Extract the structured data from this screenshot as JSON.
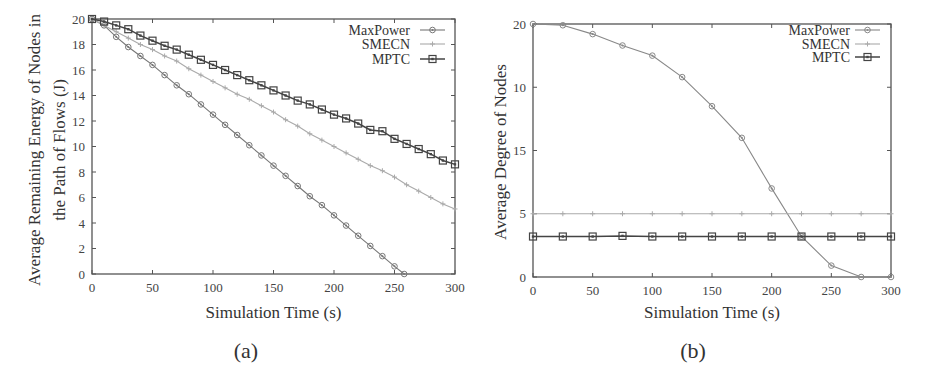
{
  "chart_data": [
    {
      "id": "a",
      "type": "line",
      "caption": "(a)",
      "title": "",
      "xlabel": "Simulation Time (s)",
      "ylabel": [
        "Average Remaining Energy of Nodes in",
        "the Path of Flows (J)"
      ],
      "xlim": [
        0,
        300
      ],
      "ylim": [
        0,
        20
      ],
      "xticks": [
        0,
        50,
        100,
        150,
        200,
        250,
        300
      ],
      "xtick_labels": [
        "0",
        "50",
        "100",
        "150",
        "200",
        "250",
        "300"
      ],
      "yticks": [
        0,
        2,
        4,
        6,
        8,
        10,
        12,
        14,
        16,
        18,
        20
      ],
      "ytick_labels": [
        "0",
        "2",
        "4",
        "6",
        "8",
        "10",
        "12",
        "14",
        "16",
        "18",
        "20"
      ],
      "grid": false,
      "legend_position": "upper right",
      "series": [
        {
          "name": "MaxPower",
          "color": "#777777",
          "marker": "circle-dot",
          "x": [
            0,
            10,
            20,
            30,
            40,
            50,
            60,
            70,
            80,
            90,
            100,
            110,
            120,
            130,
            140,
            150,
            160,
            170,
            180,
            190,
            200,
            210,
            220,
            230,
            240,
            250,
            258
          ],
          "y": [
            20,
            19.5,
            18.6,
            17.8,
            17.1,
            16.4,
            15.6,
            14.8,
            14.1,
            13.3,
            12.5,
            11.7,
            10.9,
            10.1,
            9.3,
            8.5,
            7.7,
            6.9,
            6.1,
            5.4,
            4.6,
            3.8,
            3.0,
            2.2,
            1.4,
            0.6,
            0
          ]
        },
        {
          "name": "SMECN",
          "color": "#aaaaaa",
          "marker": "plus",
          "x": [
            0,
            10,
            20,
            30,
            40,
            50,
            60,
            70,
            80,
            90,
            100,
            110,
            120,
            130,
            140,
            150,
            160,
            170,
            180,
            190,
            200,
            210,
            220,
            230,
            240,
            250,
            260,
            270,
            280,
            290,
            300
          ],
          "y": [
            20,
            19.5,
            19.0,
            18.5,
            18.0,
            17.6,
            17.1,
            16.7,
            16.1,
            15.6,
            15.1,
            14.6,
            14.1,
            13.7,
            13.2,
            12.7,
            12.1,
            11.6,
            11.0,
            10.5,
            10.0,
            9.5,
            9.0,
            8.5,
            8.1,
            7.6,
            7.0,
            6.5,
            6.0,
            5.5,
            5.1
          ]
        },
        {
          "name": "MPTC",
          "color": "#444444",
          "marker": "square",
          "x": [
            0,
            10,
            20,
            30,
            40,
            50,
            60,
            70,
            80,
            90,
            100,
            110,
            120,
            130,
            140,
            150,
            160,
            170,
            180,
            190,
            200,
            210,
            220,
            230,
            240,
            250,
            260,
            270,
            280,
            290,
            300
          ],
          "y": [
            20,
            19.8,
            19.5,
            19.2,
            18.7,
            18.3,
            17.9,
            17.6,
            17.2,
            16.8,
            16.4,
            16.0,
            15.6,
            15.2,
            14.8,
            14.4,
            14.0,
            13.6,
            13.3,
            12.9,
            12.5,
            12.2,
            11.8,
            11.3,
            11.2,
            10.6,
            10.2,
            9.8,
            9.4,
            8.9,
            8.6
          ]
        }
      ]
    },
    {
      "id": "b",
      "type": "line",
      "caption": "(b)",
      "title": "",
      "xlabel": "Simulation Time (s)",
      "ylabel": [
        "Average Degree of Nodes"
      ],
      "xlim": [
        0,
        300
      ],
      "ylim": [
        0,
        20
      ],
      "xticks": [
        0,
        50,
        100,
        150,
        200,
        250,
        300
      ],
      "xtick_labels": [
        "0",
        "50",
        "100",
        "150",
        "200",
        "250",
        "300"
      ],
      "yticks": [
        0,
        5,
        10,
        15,
        20
      ],
      "ytick_labels": [
        "0",
        "5",
        "15",
        "10",
        "20"
      ],
      "ytick_note": "tick labels as printed in figure (top to bottom): 20, 10, 15, 5, 0",
      "grid": false,
      "legend_position": "upper right",
      "series": [
        {
          "name": "MaxPower",
          "color": "#888888",
          "marker": "circle-dot",
          "x": [
            0,
            25,
            50,
            75,
            100,
            125,
            150,
            175,
            200,
            225,
            250,
            275,
            300
          ],
          "y": [
            20,
            19.9,
            19.2,
            18.3,
            17.5,
            15.8,
            13.5,
            11.0,
            7.0,
            3.2,
            0.9,
            0,
            0
          ]
        },
        {
          "name": "SMECN",
          "color": "#aaaaaa",
          "marker": "plus",
          "x": [
            0,
            25,
            50,
            75,
            100,
            125,
            150,
            175,
            200,
            225,
            250,
            275,
            300
          ],
          "y": [
            5,
            5,
            5,
            5,
            5,
            5,
            5,
            5,
            5,
            5,
            5,
            5,
            5
          ]
        },
        {
          "name": "MPTC",
          "color": "#444444",
          "marker": "square",
          "x": [
            0,
            25,
            50,
            75,
            100,
            125,
            150,
            175,
            200,
            225,
            250,
            275,
            300
          ],
          "y": [
            3.2,
            3.2,
            3.2,
            3.25,
            3.2,
            3.2,
            3.2,
            3.2,
            3.2,
            3.2,
            3.2,
            3.2,
            3.2
          ]
        }
      ]
    }
  ],
  "layout": {
    "a": {
      "left": 92,
      "right": 455,
      "top": 19,
      "bottom": 274,
      "legend_text_x": 410,
      "legend_line_x1": 420,
      "legend_line_x2": 445,
      "legend_rows_y": [
        30,
        44,
        59
      ],
      "ylabel_x": [
        34,
        59
      ],
      "ylabel_y": 150,
      "xlabel_y": 312,
      "caption_x": 246,
      "caption_y": 358
    },
    "b": {
      "left": 533,
      "right": 891,
      "top": 24,
      "bottom": 277,
      "legend_text_x": 850,
      "legend_line_x1": 855,
      "legend_line_x2": 880,
      "legend_rows_y": [
        30,
        44,
        57
      ],
      "ylabel_x": [
        500
      ],
      "ylabel_y": 152,
      "xlabel_y": 312,
      "caption_x": 693,
      "caption_y": 358
    }
  }
}
